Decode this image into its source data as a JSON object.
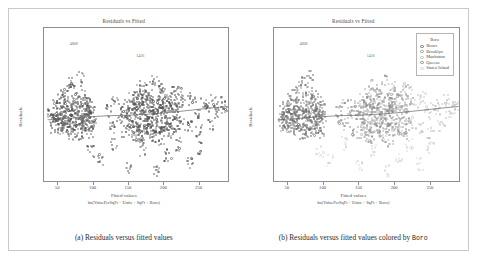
{
  "figure": {
    "panels": [
      {
        "id": "a",
        "title": "Residuals vs Fitted",
        "caption_prefix": "(a) Residuals versus fitted values",
        "caption_mono": "",
        "colored_by_boro": false
      },
      {
        "id": "b",
        "title": "Residuals vs Fitted",
        "caption_prefix": "(b) Residuals versus fitted values colored by ",
        "caption_mono": "Boro",
        "colored_by_boro": true
      }
    ],
    "legend": {
      "title": "Boro",
      "items": [
        {
          "label": "Bronx",
          "color": "#707070"
        },
        {
          "label": "Brooklyn",
          "color": "#9a9a9a"
        },
        {
          "label": "Manhattan",
          "color": "#bdbdbd"
        },
        {
          "label": "Queens",
          "color": "#8a8a8a"
        },
        {
          "label": "Staten Island",
          "color": "#d2d2d2"
        }
      ]
    },
    "outlier_labels": [
      {
        "text": "4808",
        "x": 72,
        "y": 258
      },
      {
        "text": "1456",
        "x": 166,
        "y": 218
      }
    ]
  },
  "chart_data": {
    "type": "scatter",
    "title": "Residuals vs Fitted",
    "xlabel": "Fitted values",
    "xsublabel": "lm(ValuePerSqFt ~ Units + SqFt + Boro)",
    "ylabel": "Residuals",
    "xlim": [
      30,
      290
    ],
    "ylim": [
      -220,
      310
    ],
    "xticks": [
      50,
      100,
      150,
      200,
      250
    ],
    "yticks": [
      300,
      200,
      100,
      0,
      -100,
      -200
    ],
    "grid": false,
    "legend_position": "top-right",
    "reference_line": {
      "y": 0,
      "style": "none"
    },
    "smooth": {
      "name": "loess",
      "x": [
        35,
        60,
        90,
        120,
        150,
        180,
        210,
        240,
        270,
        288
      ],
      "y": [
        -8,
        -4,
        2,
        6,
        8,
        12,
        18,
        26,
        34,
        38
      ]
    },
    "series": [
      {
        "name": "Bronx",
        "color": "#707070",
        "points": [
          [
            40,
            5
          ],
          [
            42,
            -12
          ],
          [
            44,
            18
          ],
          [
            45,
            -30
          ],
          [
            47,
            9
          ],
          [
            48,
            40
          ],
          [
            50,
            -20
          ],
          [
            51,
            25
          ],
          [
            52,
            -8
          ],
          [
            53,
            60
          ],
          [
            54,
            -45
          ],
          [
            55,
            12
          ],
          [
            56,
            30
          ],
          [
            57,
            -18
          ],
          [
            58,
            75
          ],
          [
            59,
            -5
          ],
          [
            60,
            22
          ],
          [
            61,
            -38
          ],
          [
            62,
            50
          ],
          [
            63,
            8
          ],
          [
            64,
            -25
          ],
          [
            65,
            95
          ],
          [
            66,
            15
          ],
          [
            67,
            -55
          ],
          [
            68,
            35
          ],
          [
            69,
            -10
          ],
          [
            70,
            120
          ],
          [
            71,
            28
          ],
          [
            72,
            -42
          ],
          [
            73,
            18
          ],
          [
            74,
            66
          ],
          [
            75,
            -22
          ],
          [
            76,
            44
          ],
          [
            77,
            5
          ],
          [
            78,
            -60
          ],
          [
            79,
            88
          ],
          [
            80,
            20
          ],
          [
            81,
            -30
          ],
          [
            82,
            140
          ],
          [
            83,
            12
          ],
          [
            84,
            -18
          ],
          [
            85,
            55
          ],
          [
            86,
            -48
          ],
          [
            87,
            30
          ],
          [
            88,
            70
          ],
          [
            89,
            -8
          ],
          [
            90,
            25
          ],
          [
            91,
            -35
          ],
          [
            92,
            15
          ],
          [
            93,
            48
          ],
          [
            94,
            -25
          ],
          [
            95,
            10
          ],
          [
            96,
            -52
          ],
          [
            97,
            38
          ],
          [
            98,
            5
          ],
          [
            99,
            -15
          ]
        ]
      },
      {
        "name": "Brooklyn",
        "color": "#9a9a9a",
        "points": [
          [
            150,
            10
          ],
          [
            152,
            -20
          ],
          [
            154,
            35
          ],
          [
            155,
            -55
          ],
          [
            157,
            60
          ],
          [
            158,
            5
          ],
          [
            160,
            -35
          ],
          [
            162,
            90
          ],
          [
            163,
            -12
          ],
          [
            165,
            45
          ],
          [
            166,
            -70
          ],
          [
            168,
            25
          ],
          [
            170,
            110
          ],
          [
            171,
            -28
          ],
          [
            173,
            55
          ],
          [
            175,
            -45
          ],
          [
            176,
            15
          ],
          [
            178,
            80
          ],
          [
            180,
            -18
          ],
          [
            182,
            38
          ],
          [
            183,
            -62
          ],
          [
            185,
            130
          ],
          [
            186,
            8
          ],
          [
            188,
            -32
          ],
          [
            190,
            65
          ],
          [
            192,
            -15
          ],
          [
            194,
            42
          ],
          [
            195,
            -80
          ],
          [
            197,
            22
          ],
          [
            199,
            95
          ],
          [
            200,
            -25
          ],
          [
            202,
            50
          ],
          [
            204,
            -40
          ],
          [
            205,
            18
          ],
          [
            207,
            72
          ],
          [
            209,
            -10
          ],
          [
            211,
            33
          ],
          [
            213,
            -58
          ],
          [
            215,
            100
          ],
          [
            216,
            12
          ],
          [
            218,
            -22
          ],
          [
            220,
            58
          ]
        ]
      },
      {
        "name": "Manhattan",
        "color": "#bdbdbd",
        "points": [
          [
            160,
            30
          ],
          [
            165,
            -40
          ],
          [
            170,
            75
          ],
          [
            175,
            -15
          ],
          [
            180,
            50
          ],
          [
            185,
            -65
          ],
          [
            190,
            25
          ],
          [
            195,
            105
          ],
          [
            200,
            -30
          ],
          [
            205,
            60
          ],
          [
            210,
            -45
          ],
          [
            215,
            40
          ],
          [
            220,
            85
          ],
          [
            225,
            -20
          ],
          [
            230,
            55
          ],
          [
            235,
            -35
          ],
          [
            240,
            70
          ],
          [
            245,
            15
          ],
          [
            250,
            -50
          ],
          [
            255,
            45
          ],
          [
            260,
            30
          ],
          [
            265,
            -25
          ],
          [
            270,
            60
          ],
          [
            275,
            20
          ],
          [
            280,
            48
          ],
          [
            285,
            35
          ]
        ]
      },
      {
        "name": "Queens",
        "color": "#8a8a8a",
        "points": [
          [
            120,
            20
          ],
          [
            125,
            -30
          ],
          [
            130,
            55
          ],
          [
            135,
            -10
          ],
          [
            140,
            40
          ],
          [
            145,
            -50
          ],
          [
            148,
            18
          ],
          [
            152,
            70
          ],
          [
            156,
            -22
          ],
          [
            160,
            35
          ],
          [
            164,
            -60
          ],
          [
            168,
            48
          ],
          [
            172,
            12
          ],
          [
            176,
            -38
          ],
          [
            180,
            62
          ],
          [
            184,
            -8
          ],
          [
            188,
            28
          ],
          [
            192,
            -45
          ],
          [
            196,
            52
          ],
          [
            200,
            15
          ]
        ]
      },
      {
        "name": "Staten Island",
        "color": "#d2d2d2",
        "points": [
          [
            95,
            -120
          ],
          [
            110,
            -150
          ],
          [
            130,
            -90
          ],
          [
            150,
            -170
          ],
          [
            170,
            -110
          ],
          [
            190,
            -185
          ],
          [
            205,
            -130
          ],
          [
            220,
            -95
          ],
          [
            235,
            -160
          ],
          [
            250,
            -105
          ]
        ]
      }
    ]
  }
}
